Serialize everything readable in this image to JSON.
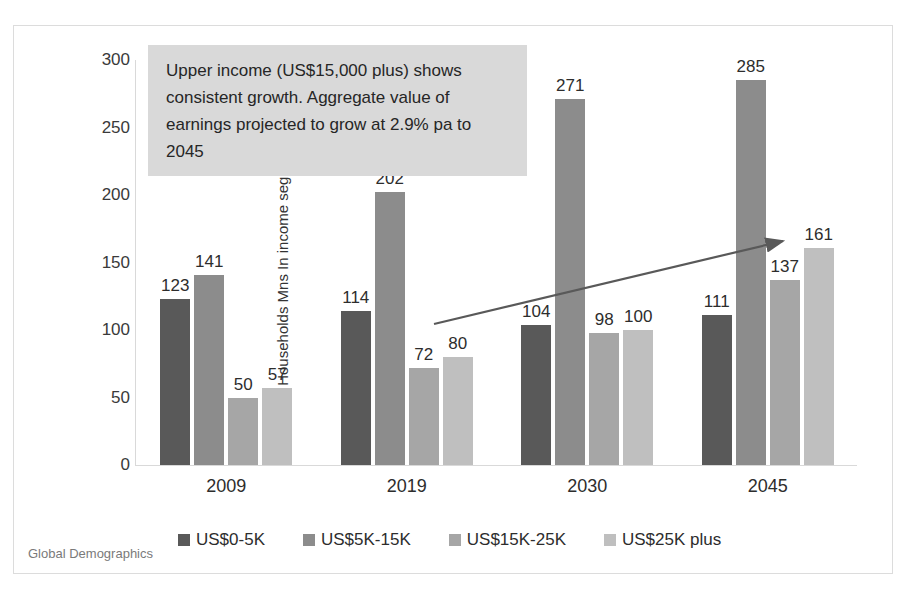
{
  "chart_data": {
    "type": "bar",
    "title": "",
    "xlabel": "",
    "ylabel": "Households Mns In income segment",
    "categories": [
      "2009",
      "2019",
      "2030",
      "2045"
    ],
    "series": [
      {
        "name": "US$0-5K",
        "color": "#595959",
        "values": [
          123,
          114,
          104,
          111
        ]
      },
      {
        "name": "US$5K-15K",
        "color": "#8c8c8c",
        "values": [
          141,
          202,
          271,
          285
        ]
      },
      {
        "name": "US$15K-25K",
        "color": "#a6a6a6",
        "values": [
          50,
          72,
          98,
          137
        ]
      },
      {
        "name": "US$25K plus",
        "color": "#bfbfbf",
        "values": [
          57,
          80,
          100,
          161
        ]
      }
    ],
    "ylim": [
      0,
      300
    ],
    "yticks": [
      0,
      50,
      100,
      150,
      200,
      250,
      300
    ],
    "grid": false,
    "legend_position": "bottom",
    "data_labels": true,
    "annotations": [
      {
        "name": "upper-income-callout",
        "text": "Upper income (US$15,000 plus) shows consistent growth.  Aggregate value of earnings projected to grow at 2.9% pa to 2045",
        "background": "#d9d9d9"
      },
      {
        "name": "growth-trend-arrow",
        "shape": "arrow",
        "color": "#595959"
      }
    ]
  },
  "source": {
    "label": "Global Demographics"
  }
}
